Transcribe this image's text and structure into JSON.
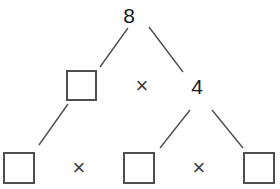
{
  "diagram": {
    "kind": "factor-tree",
    "title": "",
    "background_color": "#ffffff",
    "stroke_color": "#4e4e4e",
    "text_color": "#1a1a1a",
    "box_fill": "#ffffff",
    "levels": [
      {
        "level": 1,
        "name": "root-row",
        "nodes": [
          {
            "id": "root",
            "type": "number",
            "label": "8"
          }
        ]
      },
      {
        "level": 2,
        "name": "middle-row",
        "nodes": [
          {
            "id": "m-box",
            "type": "blank-box",
            "label": ""
          },
          {
            "id": "m-op",
            "type": "operator",
            "label": "×"
          },
          {
            "id": "m-num",
            "type": "number",
            "label": "4"
          }
        ]
      },
      {
        "level": 3,
        "name": "bottom-row",
        "nodes": [
          {
            "id": "b-box1",
            "type": "blank-box",
            "label": ""
          },
          {
            "id": "b-op1",
            "type": "operator",
            "label": "×"
          },
          {
            "id": "b-box2",
            "type": "blank-box",
            "label": ""
          },
          {
            "id": "b-op2",
            "type": "operator",
            "label": "×"
          },
          {
            "id": "b-box3",
            "type": "blank-box",
            "label": ""
          }
        ]
      }
    ],
    "branches": [
      {
        "id": "root-to-m-box",
        "from": "root",
        "to": "m-box",
        "x1": 128,
        "y1": 28,
        "x2": 100,
        "y2": 67
      },
      {
        "id": "root-to-m-num",
        "from": "root",
        "to": "m-num",
        "x1": 149,
        "y1": 27,
        "x2": 183,
        "y2": 72
      },
      {
        "id": "m-box-to-b-box1",
        "from": "m-box",
        "to": "b-box1",
        "x1": 68,
        "y1": 104,
        "x2": 39,
        "y2": 145
      },
      {
        "id": "m-num-to-b-box2",
        "from": "m-num",
        "to": "b-box2",
        "x1": 190,
        "y1": 110,
        "x2": 160,
        "y2": 148
      },
      {
        "id": "m-num-to-b-box3",
        "from": "m-num",
        "to": "b-box3",
        "x1": 212,
        "y1": 110,
        "x2": 243,
        "y2": 148
      }
    ]
  }
}
